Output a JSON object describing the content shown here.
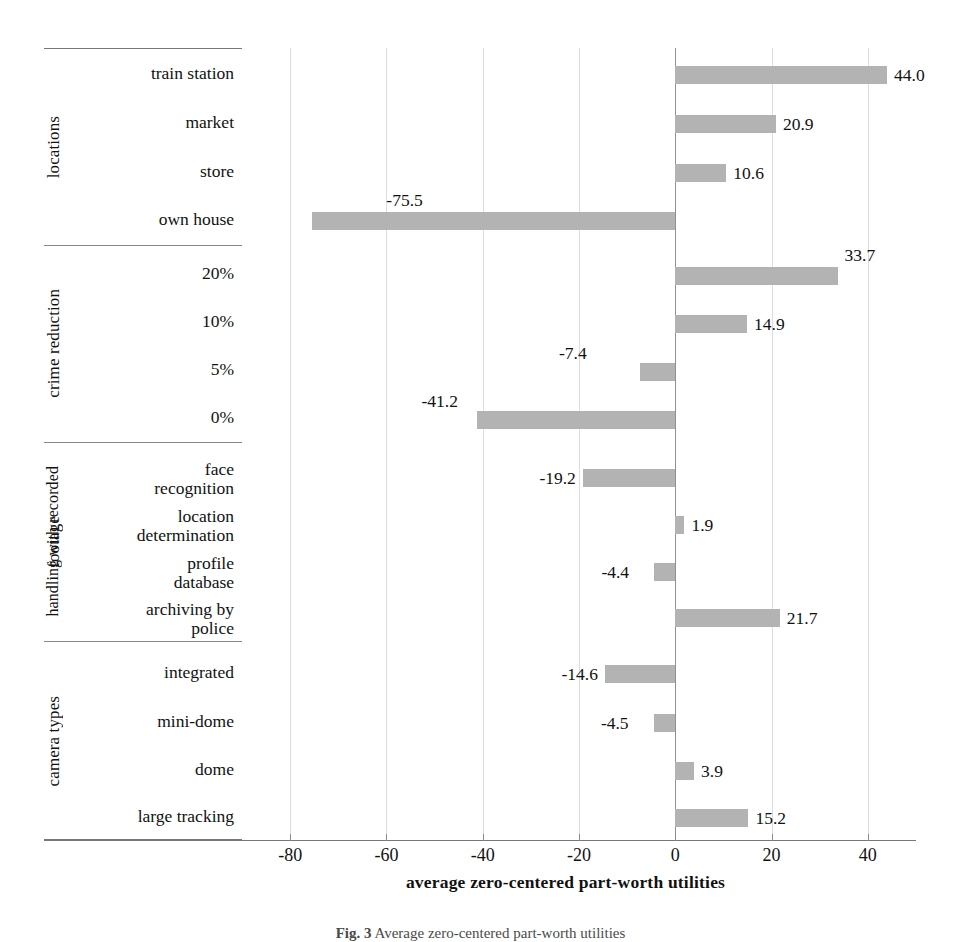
{
  "chart_data": {
    "type": "bar",
    "orientation": "horizontal",
    "title": "",
    "xlabel": "average zero-centered part-worth utilities",
    "ylabel": "",
    "xlim": [
      -90,
      50
    ],
    "xticks": [
      -80,
      -60,
      -40,
      -20,
      0,
      20,
      40
    ],
    "xticklabels": [
      "-80",
      "-60",
      "-40",
      "-20",
      "0",
      "20",
      "40"
    ],
    "grid": "vertical",
    "legend": "none",
    "bar_color": "#b3b3b3",
    "groups": [
      {
        "name": "locations",
        "name_outer": "",
        "categories": [
          "train station",
          "market",
          "store",
          "own house"
        ],
        "values": [
          44.0,
          20.9,
          10.6,
          -75.5
        ],
        "labels": [
          "44.0",
          "20.9",
          "10.6",
          "-75.5"
        ]
      },
      {
        "name": "crime reduction",
        "name_outer": "",
        "categories": [
          "20%",
          "10%",
          "5%",
          "0%"
        ],
        "values": [
          33.7,
          14.9,
          -7.4,
          -41.2
        ],
        "labels": [
          "33.7",
          "14.9",
          "-7.4",
          "-41.2"
        ]
      },
      {
        "name": "footage",
        "name_outer": "handling with recorded",
        "categories": [
          "face\nrecognition",
          "location\ndetermination",
          "profile\ndatabase",
          "archiving by\npolice"
        ],
        "values": [
          -19.2,
          1.9,
          -4.4,
          21.7
        ],
        "labels": [
          "-19.2",
          "1.9",
          "-4.4",
          "21.7"
        ]
      },
      {
        "name": "camera types",
        "name_outer": "",
        "categories": [
          "integrated",
          "mini-dome",
          "dome",
          "large tracking"
        ],
        "values": [
          -14.6,
          -4.5,
          3.9,
          15.2
        ],
        "labels": [
          "-14.6",
          "-4.5",
          "3.9",
          "15.2"
        ]
      }
    ]
  },
  "caption": {
    "prefix": "Fig. 3",
    "text": "Average zero-centered part-worth utilities"
  }
}
